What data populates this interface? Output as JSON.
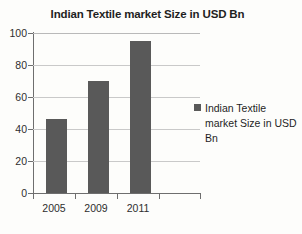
{
  "chart_data": {
    "type": "bar",
    "title": "Indian Textile market Size in USD Bn",
    "categories": [
      "2005",
      "2009",
      "2011",
      ""
    ],
    "values": [
      46,
      70,
      95,
      null
    ],
    "series": [
      {
        "name": "Indian Textile market Size in USD Bn",
        "values": [
          46,
          70,
          95,
          null
        ]
      }
    ],
    "xlabel": "",
    "ylabel": "",
    "ylim": [
      0,
      100
    ],
    "yticks": [
      0,
      20,
      40,
      60,
      80,
      100
    ],
    "ytick_labels": [
      "0",
      "20",
      "40",
      "60",
      "80",
      "100"
    ],
    "grid": true,
    "legend_position": "right",
    "bar_color": "#595959",
    "gridline_color": "#c9c9c9",
    "axis_color": "#6e6e6e",
    "background_color": "#fdfdfb"
  },
  "legend": {
    "marker": "square-marker",
    "label": "Indian Textile market Size in USD Bn"
  }
}
